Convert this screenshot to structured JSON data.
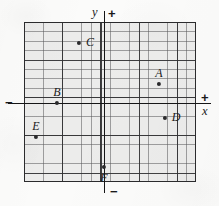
{
  "figure": {
    "type": "cartesian-coordinate-grid",
    "background_color": "#fbfbfa",
    "grid_fill_color": "#ececeb",
    "ink_color": "#1a1a1b"
  },
  "axes": {
    "x_axis_label": "x",
    "y_axis_label": "y",
    "positive_x_sign": "+",
    "negative_x_sign": "−",
    "positive_y_sign": "+",
    "negative_y_sign": "−"
  },
  "grid": {
    "minor_columns": 18,
    "minor_rows": 17,
    "major_every_n_cells": 4,
    "minor_cell_width_px": 9.56,
    "minor_cell_height_px": 9.41,
    "origin_column_index": 8,
    "origin_row_index": 8.6
  },
  "points": [
    {
      "id": "A",
      "label": "A",
      "label_position": "above",
      "x_px": 159.0,
      "y_px": 84.0,
      "grid_x": 5.8,
      "grid_y": 2.0
    },
    {
      "id": "B",
      "label": "B",
      "label_position": "above",
      "x_px": 57.0,
      "y_px": 103.0,
      "grid_x": -4.9,
      "grid_y": 0.0
    },
    {
      "id": "C",
      "label": "C",
      "label_position": "right",
      "x_px": 79.0,
      "y_px": 43.0,
      "grid_x": -2.6,
      "grid_y": 6.4
    },
    {
      "id": "D",
      "label": "D",
      "label_position": "right",
      "x_px": 165.0,
      "y_px": 118.0,
      "grid_x": 6.4,
      "grid_y": -1.6
    },
    {
      "id": "E",
      "label": "E",
      "label_position": "above",
      "x_px": 36.0,
      "y_px": 137.0,
      "grid_x": -7.1,
      "grid_y": -3.6
    },
    {
      "id": "F",
      "label": "F",
      "label_position": "below",
      "x_px": 104.0,
      "y_px": 167.0,
      "grid_x": 0.0,
      "grid_y": -6.8
    }
  ]
}
